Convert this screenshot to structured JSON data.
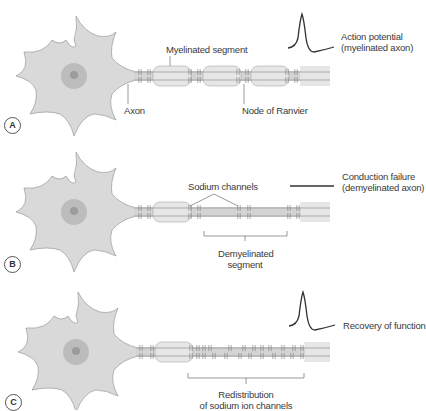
{
  "panels": [
    {
      "letter": "A",
      "labels": {
        "myelinated_segment": "Myelinated segment",
        "axon": "Axon",
        "node_of_ranvier": "Node of Ranvier",
        "signal_line1": "Action potential",
        "signal_line2": "(myelinated axon)"
      },
      "signal": "action-potential"
    },
    {
      "letter": "B",
      "labels": {
        "sodium_channels": "Sodium channels",
        "demyelinated_line1": "Demyelinated",
        "demyelinated_line2": "segment",
        "signal_line1": "Conduction failure",
        "signal_line2": "(demyelinated axon)"
      },
      "signal": "flat-line"
    },
    {
      "letter": "C",
      "labels": {
        "redistribution_line1": "Redistribution",
        "redistribution_line2": "of sodium ion channels",
        "signal_line1": "Recovery of function"
      },
      "signal": "action-potential"
    }
  ],
  "colors": {
    "cell_fill": "#d9d9d9",
    "cell_stroke": "#8a8a8a",
    "nucleus": "#b5b5b5",
    "nucleolus": "#999999",
    "myelin_fill": "#e6e6e6",
    "axon_line": "#777777",
    "trace": "#333333"
  }
}
